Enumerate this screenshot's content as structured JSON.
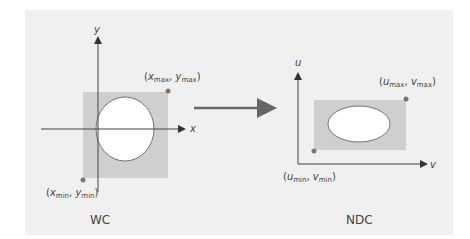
{
  "diagram": {
    "left": {
      "caption": "WC",
      "x_axis_label": "x",
      "y_axis_label": "y",
      "max_point": {
        "main1": "x",
        "sub1": "max",
        "main2": "y",
        "sub2": "max"
      },
      "min_point": {
        "main1": "x",
        "sub1": "min",
        "main2": "y",
        "sub2": "min"
      }
    },
    "right": {
      "caption": "NDC",
      "x_axis_label": "v",
      "y_axis_label": "u",
      "max_point": {
        "main1": "u",
        "sub1": "max",
        "main2": "v",
        "sub2": "max"
      },
      "min_point": {
        "main1": "u",
        "sub1": "min",
        "main2": "v",
        "sub2": "min"
      }
    },
    "colors": {
      "background": "#f0f0f0",
      "window_fill": "#cfcfcf",
      "shape_fill": "#ffffff",
      "axis": "#444444",
      "arrow": "#666666",
      "point": "#777777"
    }
  }
}
